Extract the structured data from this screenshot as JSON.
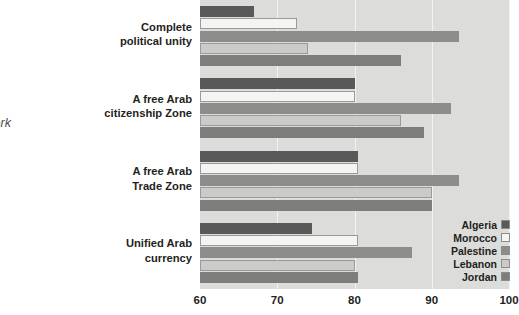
{
  "caption": {
    "lines": [
      "regional",
      "must work",
      "urgently."
    ]
  },
  "chart_data": {
    "type": "bar",
    "orientation": "horizontal",
    "title": "",
    "subtitle": "",
    "xlabel": "",
    "ylabel": "",
    "xlim": [
      60,
      100
    ],
    "xticks": [
      60,
      70,
      80,
      90,
      100
    ],
    "xtick_labels": [
      "60",
      "70",
      "80",
      "90",
      "100"
    ],
    "grid": true,
    "legend_position": "bottom-right",
    "categories": [
      "Complete political unity",
      "A free Arab citizenship Zone",
      "A free Arab Trade Zone",
      "Unified Arab currency"
    ],
    "category_lines": [
      [
        "Complete",
        "political unity"
      ],
      [
        "A free Arab",
        "citizenship Zone"
      ],
      [
        "A free Arab",
        "Trade Zone"
      ],
      [
        "Unified Arab",
        "currency"
      ]
    ],
    "series": [
      {
        "name": "Algeria",
        "color": "#595959",
        "values": [
          67,
          80,
          80.5,
          74.5
        ]
      },
      {
        "name": "Morocco",
        "color": "#f4f4f2",
        "values": [
          72.5,
          80,
          80.5,
          80.5
        ]
      },
      {
        "name": "Palestine",
        "color": "#8c8c8a",
        "values": [
          93.5,
          92.5,
          93.5,
          87.5
        ]
      },
      {
        "name": "Lebanon",
        "color": "#cbcbc9",
        "values": [
          74,
          86,
          90,
          80
        ]
      },
      {
        "name": "Jordan",
        "color": "#7d7d7b",
        "values": [
          86,
          89,
          90,
          80.5
        ]
      }
    ]
  },
  "legend": {
    "items": [
      {
        "label": "Algeria",
        "color": "#595959"
      },
      {
        "label": "Morocco",
        "color": "#f4f4f2"
      },
      {
        "label": "Palestine",
        "color": "#8c8c8a"
      },
      {
        "label": "Lebanon",
        "color": "#cbcbc9"
      },
      {
        "label": "Jordan",
        "color": "#7d7d7b"
      }
    ]
  }
}
